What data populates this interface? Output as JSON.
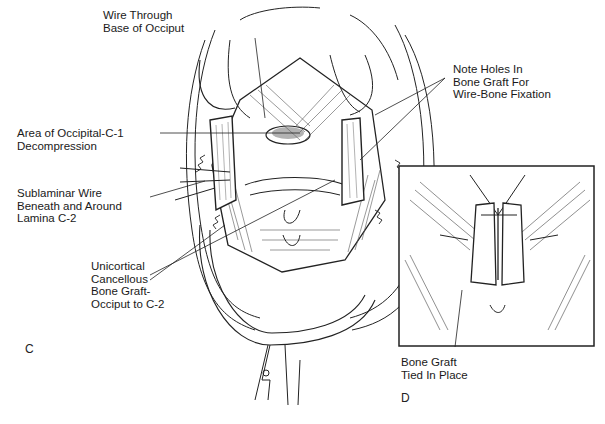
{
  "figure": {
    "panel_c": {
      "letter": "C",
      "labels": {
        "wire_through_base": "Wire Through\nBase of Occiput",
        "occipital_decompression": "Area of Occipital-C-1\nDecompression",
        "sublaminar_wire": "Sublaminar Wire\nBeneath and Around\nLamina C-2",
        "unicortical_graft": "Unicortical\nCancellous\nBone Graft-\nOcciput to C-2",
        "note_holes": "Note Holes In\nBone Graft For\nWire-Bone Fixation"
      }
    },
    "panel_d": {
      "letter": "D",
      "labels": {
        "graft_tied": "Bone Graft\nTied In Place"
      }
    }
  }
}
